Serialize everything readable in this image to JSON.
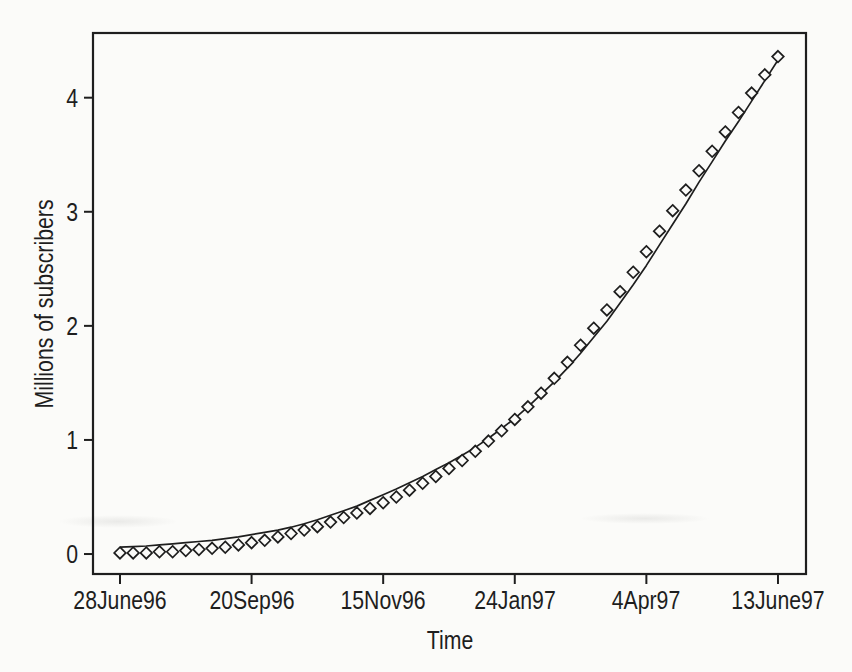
{
  "chart_data": {
    "type": "scatter",
    "title": "",
    "xlabel": "Time",
    "ylabel": "Millions of subscribers",
    "x_axis": {
      "tick_labels": [
        "28June96",
        "20Sep96",
        "15Nov96",
        "24Jan97",
        "4Apr97",
        "13June97"
      ],
      "tick_weeks": [
        0,
        10,
        20,
        30,
        40,
        50
      ],
      "range_weeks": [
        -2.05,
        52.13
      ],
      "grid": false
    },
    "y_axis": {
      "tick_labels": [
        "0",
        "1",
        "2",
        "3",
        "4"
      ],
      "tick_values": [
        0,
        1,
        2,
        3,
        4
      ],
      "range": [
        -0.175,
        4.567
      ],
      "grid": false
    },
    "series": [
      {
        "name": "Observed subscribers (weekly)",
        "style": "open-diamond-markers",
        "marker": "open-diamond",
        "week_start": 0,
        "week_step": 1,
        "values": [
          0.01,
          0.01,
          0.01,
          0.02,
          0.02,
          0.03,
          0.04,
          0.05,
          0.06,
          0.08,
          0.1,
          0.12,
          0.15,
          0.18,
          0.21,
          0.24,
          0.28,
          0.32,
          0.36,
          0.4,
          0.45,
          0.5,
          0.56,
          0.62,
          0.68,
          0.75,
          0.82,
          0.9,
          0.99,
          1.08,
          1.18,
          1.29,
          1.41,
          1.54,
          1.68,
          1.83,
          1.98,
          2.14,
          2.3,
          2.47,
          2.65,
          2.83,
          3.01,
          3.19,
          3.36,
          3.53,
          3.7,
          3.87,
          4.04,
          4.2,
          4.36
        ]
      },
      {
        "name": "Fitted growth curve",
        "style": "solid-line",
        "week_start": 0,
        "week_step": 1,
        "values": [
          0.06,
          0.065,
          0.07,
          0.08,
          0.09,
          0.1,
          0.11,
          0.12,
          0.135,
          0.15,
          0.17,
          0.19,
          0.21,
          0.235,
          0.265,
          0.3,
          0.34,
          0.38,
          0.42,
          0.47,
          0.52,
          0.57,
          0.625,
          0.68,
          0.74,
          0.8,
          0.865,
          0.935,
          1.015,
          1.1,
          1.19,
          1.29,
          1.4,
          1.51,
          1.63,
          1.76,
          1.9,
          2.04,
          2.2,
          2.36,
          2.53,
          2.71,
          2.89,
          3.07,
          3.26,
          3.44,
          3.62,
          3.79,
          3.97,
          4.15,
          4.33
        ]
      }
    ],
    "legend": "none",
    "colors": {
      "ink": "#1e1e1e",
      "paper": "#fbfbf9"
    }
  }
}
